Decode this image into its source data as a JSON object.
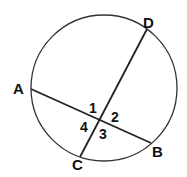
{
  "diagram": {
    "type": "circle-with-intersecting-chords",
    "colors": {
      "stroke": "#333333",
      "text": "#111111",
      "background": "#ffffff"
    },
    "circle": {
      "cx": 104,
      "cy": 88,
      "r": 73
    },
    "points": {
      "A": {
        "label": "A",
        "x": 31,
        "y": 89
      },
      "B": {
        "label": "B",
        "x": 151,
        "y": 143
      },
      "C": {
        "label": "C",
        "x": 80,
        "y": 157
      },
      "D": {
        "label": "D",
        "x": 147,
        "y": 29
      }
    },
    "chords": [
      {
        "name": "AB",
        "from": "A",
        "to": "B"
      },
      {
        "name": "CD",
        "from": "C",
        "to": "D"
      }
    ],
    "angles": [
      {
        "label": "1"
      },
      {
        "label": "2"
      },
      {
        "label": "3"
      },
      {
        "label": "4"
      }
    ]
  }
}
